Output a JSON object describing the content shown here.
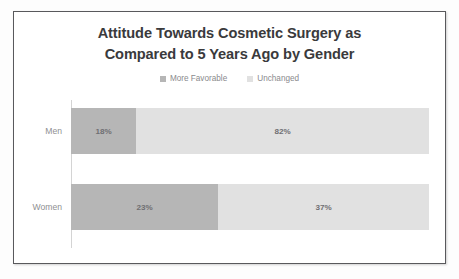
{
  "chart_data": {
    "type": "bar",
    "orientation": "horizontal",
    "stacked": true,
    "title": "Attitude Towards Cosmetic Surgery as\nCompared to 5 Years Ago  by Gender",
    "title_line1": "Attitude Towards Cosmetic Surgery as",
    "title_line2": "Compared to 5 Years Ago  by Gender",
    "xlabel": "",
    "ylabel": "",
    "grid": false,
    "legend_position": "top",
    "categories": [
      "Men",
      "Women"
    ],
    "series": [
      {
        "name": "More Favorable",
        "color": "#b6b6b6",
        "values": [
          18,
          23
        ],
        "labels": [
          "18%",
          "23%"
        ]
      },
      {
        "name": "Unchanged",
        "color": "#e1e1e1",
        "values": [
          82,
          37
        ],
        "labels": [
          "82%",
          "37%"
        ]
      }
    ],
    "bars": [
      {
        "category": "Men",
        "segments": [
          {
            "series": "More Favorable",
            "value": 18,
            "label": "18%",
            "color": "#b6b6b6",
            "width_px": 65
          },
          {
            "series": "Unchanged",
            "value": 82,
            "label": "82%",
            "color": "#e1e1e1",
            "width_px": 293
          }
        ]
      },
      {
        "category": "Women",
        "segments": [
          {
            "series": "More Favorable",
            "value": 23,
            "label": "23%",
            "color": "#b6b6b6",
            "width_px": 147
          },
          {
            "series": "Unchanged",
            "value": 37,
            "label": "37%",
            "color": "#e1e1e1",
            "width_px": 211
          }
        ]
      }
    ]
  },
  "legend": {
    "entries": [
      {
        "label": "More Favorable",
        "color": "#b6b6b6"
      },
      {
        "label": "Unchanged",
        "color": "#e1e1e1"
      }
    ]
  },
  "colors": {
    "more_favorable": "#b6b6b6",
    "unchanged": "#e1e1e1",
    "frame_border": "#59595c",
    "axis_line": "#d4d4d4",
    "title_text": "#3a3a3c",
    "label_text": "#8f8f92",
    "value_text": "#6f6f72",
    "background": "#ffffff"
  }
}
